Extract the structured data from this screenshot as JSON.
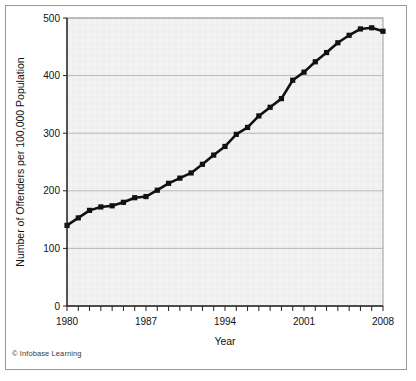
{
  "credit": "© Infobase Learning",
  "chart_data": {
    "type": "line",
    "title": "",
    "xlabel": "Year",
    "ylabel": "Number of Offenders per 100,000 Population",
    "xlim": [
      1980,
      2008
    ],
    "ylim": [
      0,
      500
    ],
    "yticks": [
      0,
      100,
      200,
      300,
      400,
      500
    ],
    "ytick_labels": [
      "0",
      "100",
      "200",
      "300",
      "400",
      "500"
    ],
    "xtick_labels": [
      "1980",
      "1987",
      "1994",
      "2001",
      "2008"
    ],
    "xtick_values": [
      1980,
      1987,
      1994,
      2001,
      2008
    ],
    "xticks_minor_every": 1,
    "grid": "horizontal",
    "legend": "none",
    "marker": "square",
    "line_color": "#111111",
    "plot_background": "#f1f1f1",
    "x": [
      1980,
      1981,
      1982,
      1983,
      1984,
      1985,
      1986,
      1987,
      1988,
      1989,
      1990,
      1991,
      1992,
      1993,
      1994,
      1995,
      1996,
      1997,
      1998,
      1999,
      2000,
      2001,
      2002,
      2003,
      2004,
      2005,
      2006,
      2007,
      2008
    ],
    "values": [
      140,
      153,
      166,
      172,
      174,
      180,
      188,
      190,
      201,
      213,
      222,
      231,
      246,
      262,
      277,
      298,
      310,
      330,
      345,
      360,
      392,
      406,
      424,
      440,
      457,
      470,
      481,
      483,
      477
    ],
    "series": [
      {
        "name": "Offenders per 100,000 population",
        "values": [
          140,
          153,
          166,
          172,
          174,
          180,
          188,
          190,
          201,
          213,
          222,
          231,
          246,
          262,
          277,
          298,
          310,
          330,
          345,
          360,
          392,
          406,
          424,
          440,
          457,
          470,
          481,
          483,
          477
        ]
      }
    ],
    "points": [
      {
        "year": 1980,
        "value": 140
      },
      {
        "year": 1981,
        "value": 153
      },
      {
        "year": 1982,
        "value": 166
      },
      {
        "year": 1983,
        "value": 172
      },
      {
        "year": 1984,
        "value": 174
      },
      {
        "year": 1985,
        "value": 180
      },
      {
        "year": 1986,
        "value": 188
      },
      {
        "year": 1987,
        "value": 190
      },
      {
        "year": 1988,
        "value": 201
      },
      {
        "year": 1989,
        "value": 213
      },
      {
        "year": 1990,
        "value": 222
      },
      {
        "year": 1991,
        "value": 231
      },
      {
        "year": 1992,
        "value": 246
      },
      {
        "year": 1993,
        "value": 262
      },
      {
        "year": 1994,
        "value": 277
      },
      {
        "year": 1995,
        "value": 298
      },
      {
        "year": 1996,
        "value": 310
      },
      {
        "year": 1997,
        "value": 330
      },
      {
        "year": 1998,
        "value": 345
      },
      {
        "year": 1999,
        "value": 360
      },
      {
        "year": 2000,
        "value": 392
      },
      {
        "year": 2001,
        "value": 406
      },
      {
        "year": 2002,
        "value": 424
      },
      {
        "year": 2003,
        "value": 440
      },
      {
        "year": 2004,
        "value": 457
      },
      {
        "year": 2005,
        "value": 470
      },
      {
        "year": 2006,
        "value": 481
      },
      {
        "year": 2007,
        "value": 483
      },
      {
        "year": 2008,
        "value": 477
      }
    ]
  }
}
